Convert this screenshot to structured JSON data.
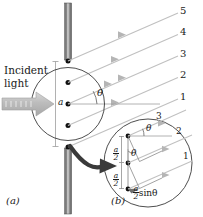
{
  "figure": {
    "subfigures": [
      {
        "id": "a",
        "label": "(a)"
      },
      {
        "id": "b",
        "label": "(b)"
      }
    ],
    "colors": {
      "ray": "#b9b9b9",
      "barrier_dark": "#4d4d4d",
      "barrier_light": "#c9c9c9",
      "outline": "#1a1a1a",
      "incident_arrow": "#bdbdbd",
      "zoom_arrow": "#3a3a3a",
      "background": "#ffffff"
    }
  },
  "panel_a": {
    "incident_label_line1": "Incident",
    "incident_label_line2": "light",
    "slit_width_label": "a",
    "angle_label": "θ",
    "ray_labels": [
      "5",
      "4",
      "3",
      "2",
      "1"
    ],
    "source_point_count": 5,
    "caption": "(a)"
  },
  "panel_b": {
    "ray_labels": [
      "3",
      "2",
      "1"
    ],
    "angle_labels": [
      "θ",
      "θ"
    ],
    "half_width_numerator": "a",
    "half_width_denominator": "2",
    "path_difference_numerator": "a",
    "path_difference_denominator": "2",
    "path_difference_suffix": "sinθ",
    "source_point_count": 3,
    "caption": "(b)"
  }
}
